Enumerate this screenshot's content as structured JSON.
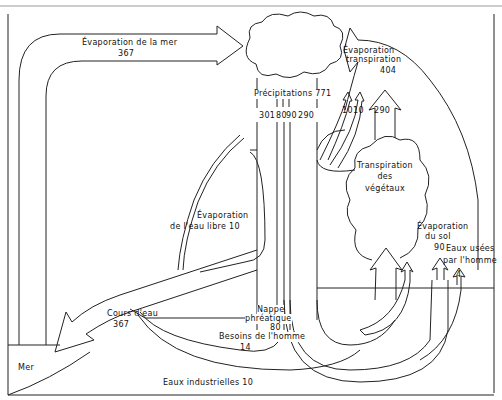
{
  "diagram": {
    "labels": {
      "sea_evaporation": "Évaporation de la mer",
      "sea_evaporation_value": "367",
      "evapotranspiration_1": "Évaporation",
      "evapotranspiration_2": "transpiration",
      "evapotranspiration_value": "404",
      "precipitation": "Précipitations 771",
      "precip_split": [
        "301",
        "80",
        "90",
        "290"
      ],
      "small_flows": [
        "10",
        "10"
      ],
      "transpiration_value": "290",
      "plant_transpiration_1": "Transpiration",
      "plant_transpiration_2": "des",
      "plant_transpiration_3": "végétaux",
      "free_water_evap_1": "Évaporation",
      "free_water_evap_2": "de l'eau libre 10",
      "soil_evap_1": "Évaporation",
      "soil_evap_2": "du sol",
      "soil_evap_value": "90",
      "wastewater_1": "Eaux usées",
      "wastewater_2": "par l'homme",
      "wastewater_value": "4",
      "river_1": "Cours d'eau",
      "river_value": "367",
      "groundwater_1": "Nappe",
      "groundwater_2": "phréatique",
      "groundwater_value": "80",
      "human_needs_1": "Besoins de l'homme",
      "human_needs_value": "14",
      "sea": "Mer",
      "industrial_water": "Eaux industrielles 10"
    },
    "colors": {
      "line": "#222222",
      "background": "#ffffff"
    }
  }
}
